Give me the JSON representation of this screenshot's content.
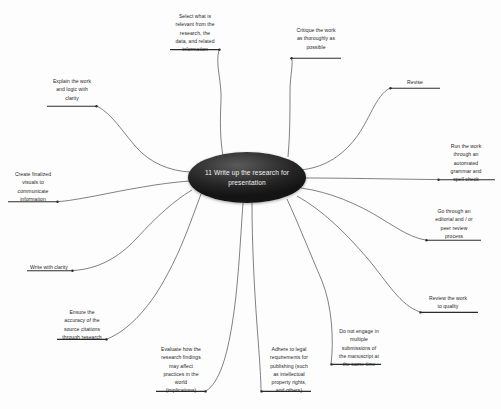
{
  "diagram": {
    "type": "mind-map",
    "title": "11 Write up the research for presentation",
    "center": {
      "label": "11 Write up the research for presentation",
      "shape": "ellipse",
      "fill": "#242424",
      "text_color": "#f0f0f0"
    },
    "style": {
      "background": "#fdfdfd",
      "branch_stroke": "#4a4a4a",
      "underline_stroke": "#2b2b2b",
      "label_color": "#1f1f1f"
    },
    "branches": [
      {
        "id": "explain-work-logic",
        "label": "Explain the work\nand logic with\nclarity",
        "position": "upper-left"
      },
      {
        "id": "select-relevant",
        "label": "Select what is\nrelevant from the\nresearch, the\ndata, and related\ninformation",
        "position": "top-left-center"
      },
      {
        "id": "critique-work",
        "label": "Critique the work\nas thoroughly as\npossible",
        "position": "top-right-center"
      },
      {
        "id": "revise",
        "label": "Revise",
        "position": "upper-right"
      },
      {
        "id": "automated-grammar-spell-check",
        "label": "Run the work\nthrough an\nautomated\ngrammar and\nspell check",
        "position": "right"
      },
      {
        "id": "editorial-peer-review",
        "label": "Go through an\neditorial and / or\npeer review\nprocess",
        "position": "lower-right"
      },
      {
        "id": "review-work-quality",
        "label": "Review the work\nto quality",
        "position": "bottom-right"
      },
      {
        "id": "no-multiple-submissions",
        "label": "Do not engage in\nmultiple\nsubmissions of\nthe manuscript at\nthe same time",
        "position": "bottom-right-center"
      },
      {
        "id": "adhere-legal-requirements",
        "label": "Adhere to legal\nrequirements for\npublishing (such\nas intellectual\nproperty rights,\nand others)",
        "position": "bottom-center"
      },
      {
        "id": "evaluate-implications",
        "label": "Evaluate how the\nresearch findings\nmay affect\npractices in the\nworld\n(implications)",
        "position": "bottom-left-center"
      },
      {
        "id": "ensure-citation-accuracy",
        "label": "Ensure the\naccuracy of the\nsource citations\nthrough research",
        "position": "bottom-left"
      },
      {
        "id": "write-with-clarity",
        "label": "Write with clarity",
        "position": "lower-left"
      },
      {
        "id": "create-finalized-visuals",
        "label": "Create finalized\nvisuals to\ncommunicate\ninformation",
        "position": "left"
      }
    ]
  }
}
